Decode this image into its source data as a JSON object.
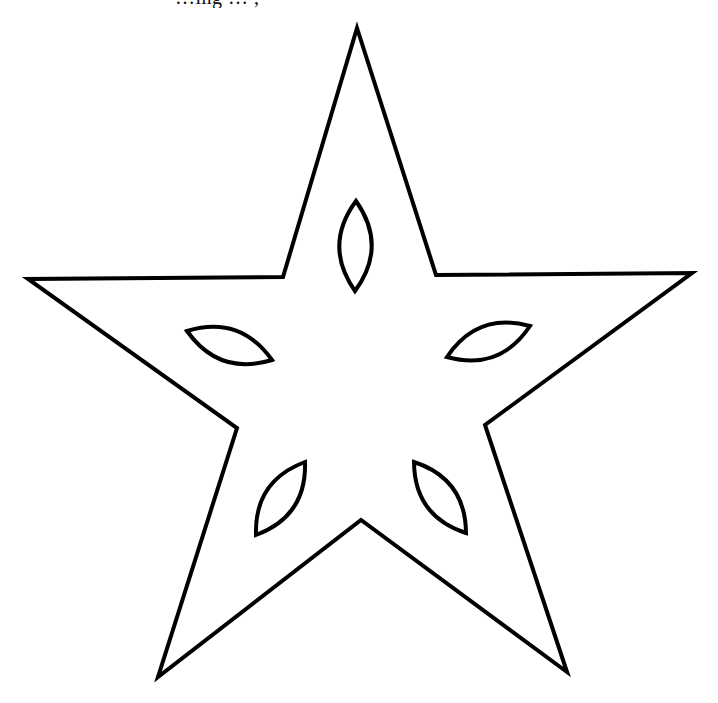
{
  "caption": {
    "text": "…ing … ,"
  },
  "figure": {
    "type": "star-outline",
    "stroke_color": "#000000",
    "fill_color": "#ffffff",
    "stroke_width": 4,
    "outer_points": [
      [
        357,
        28
      ],
      [
        436,
        275
      ],
      [
        692,
        273
      ],
      [
        485,
        425
      ],
      [
        567,
        672
      ],
      [
        361,
        520
      ],
      [
        158,
        677
      ],
      [
        237,
        428
      ],
      [
        28,
        279
      ],
      [
        283,
        277
      ]
    ],
    "leaves": [
      {
        "name": "top",
        "from": [
          356,
          201
        ],
        "to": [
          355,
          291
        ]
      },
      {
        "name": "left",
        "from": [
          187,
          331
        ],
        "to": [
          272,
          360
        ]
      },
      {
        "name": "right",
        "from": [
          447,
          357
        ],
        "to": [
          530,
          326
        ]
      },
      {
        "name": "bottom-left",
        "from": [
          305,
          462
        ],
        "to": [
          256,
          535
        ]
      },
      {
        "name": "bottom-right",
        "from": [
          414,
          462
        ],
        "to": [
          466,
          533
        ]
      }
    ]
  }
}
